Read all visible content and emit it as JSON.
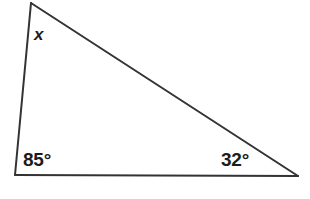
{
  "figure": {
    "name": "triangle-angle-diagram",
    "background_color": "#ffffff",
    "width": 310,
    "height": 199,
    "stroke_color": "#333333",
    "stroke_width": 2,
    "text_color": "#1c1c1c"
  },
  "chart_data": {
    "type": "diagram",
    "title": "",
    "subtitle": "",
    "xlabel": "",
    "ylabel": "",
    "shape": "triangle",
    "vertices": [
      {
        "id": "apex",
        "label": "x",
        "x": 31,
        "y": 3
      },
      {
        "id": "bottom-left",
        "label": "85°",
        "x": 15,
        "y": 175
      },
      {
        "id": "bottom-right",
        "label": "32°",
        "x": 298,
        "y": 176
      }
    ],
    "edges": [
      {
        "from": "apex",
        "to": "bottom-left"
      },
      {
        "from": "apex",
        "to": "bottom-right"
      },
      {
        "from": "bottom-left",
        "to": "bottom-right"
      }
    ],
    "angles": [
      {
        "vertex": "apex",
        "label": "x",
        "value": null,
        "unit": "degrees",
        "known": false
      },
      {
        "vertex": "bottom-left",
        "label": "85°",
        "value": 85,
        "unit": "degrees",
        "known": true
      },
      {
        "vertex": "bottom-right",
        "label": "32°",
        "value": 32,
        "unit": "degrees",
        "known": true
      }
    ],
    "annotations": [
      "x",
      "85°",
      "32°"
    ],
    "legend": [],
    "grid": false
  },
  "labels": {
    "unknown_angle": "x",
    "bottom_left_angle": "85°",
    "bottom_right_angle": "32°"
  }
}
